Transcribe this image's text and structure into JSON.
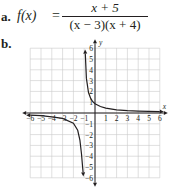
{
  "problem": {
    "part_a_label": "a.",
    "part_b_label": "b.",
    "function_lhs": "f(x)",
    "equals": "=",
    "numerator": "x + 5",
    "denominator": "(x − 3)(x + 4)"
  },
  "chart_data": {
    "type": "line",
    "title": "",
    "xlabel": "x",
    "ylabel": "y",
    "xlim": [
      -6,
      6
    ],
    "ylim": [
      -6,
      6
    ],
    "grid": true,
    "x_ticks": [
      "-6",
      "-5",
      "-4",
      "-3",
      "-2",
      "-1",
      "1",
      "2",
      "3",
      "4",
      "5",
      "6"
    ],
    "y_ticks": [
      "-6",
      "-5",
      "-4",
      "-3",
      "-2",
      "-1",
      "1",
      "2",
      "3",
      "4",
      "5",
      "6"
    ],
    "series": [
      {
        "name": "right branch (x > -1)",
        "x": [
          -0.9,
          -0.8,
          -0.6,
          -0.4,
          -0.2,
          0,
          0.5,
          1,
          2,
          3,
          4,
          5,
          6
        ],
        "y": [
          5.5,
          3.2,
          1.9,
          1.35,
          1.05,
          0.85,
          0.6,
          0.45,
          0.3,
          0.22,
          0.18,
          0.15,
          0.13
        ]
      },
      {
        "name": "left branch (x < -1)",
        "x": [
          -6,
          -5,
          -4,
          -3,
          -2,
          -1.6,
          -1.4,
          -1.25,
          -1.15,
          -1.1
        ],
        "y": [
          -0.2,
          -0.25,
          -0.35,
          -0.5,
          -0.95,
          -1.6,
          -2.5,
          -3.8,
          -5.0,
          -5.5
        ]
      }
    ],
    "asymptotes": {
      "vertical": [
        -1
      ],
      "horizontal": [
        0
      ]
    }
  },
  "colors": {
    "curve": "#231f20",
    "grid": "#c9c9c9",
    "axis": "#231f20"
  }
}
